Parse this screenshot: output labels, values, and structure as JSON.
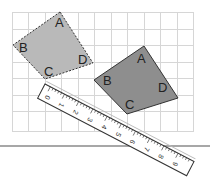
{
  "figure": {
    "colors": {
      "grid": "#d6d6d6",
      "original_fill": "#b9b9b9",
      "image_fill": "#8e8e8e",
      "outline": "#333333",
      "baseline": "#8a8a8a"
    },
    "original_shape": {
      "style": "dashed",
      "labels": {
        "A": "A",
        "B": "B",
        "C": "C",
        "D": "D"
      }
    },
    "image_shape": {
      "style": "solid",
      "labels": {
        "A": "A",
        "B": "B",
        "C": "C",
        "D": "D"
      }
    },
    "ruler": {
      "numbers": [
        "0",
        "1",
        "2",
        "3",
        "4",
        "5",
        "6",
        "7",
        "8",
        "9"
      ]
    }
  }
}
